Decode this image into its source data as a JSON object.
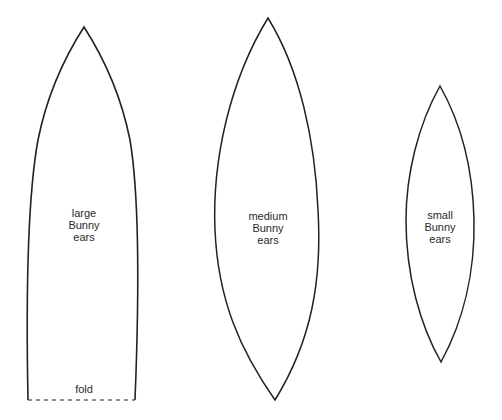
{
  "diagram": {
    "stroke_color": "#222222",
    "background": "#ffffff",
    "shapes": [
      {
        "id": "large",
        "label_lines": [
          "large",
          "Bunny",
          "ears"
        ],
        "fold_label": "fold",
        "fold_line": "dashed"
      },
      {
        "id": "medium",
        "label_lines": [
          "medium",
          "Bunny",
          "ears"
        ]
      },
      {
        "id": "small",
        "label_lines": [
          "small",
          "Bunny",
          "ears"
        ]
      }
    ]
  }
}
